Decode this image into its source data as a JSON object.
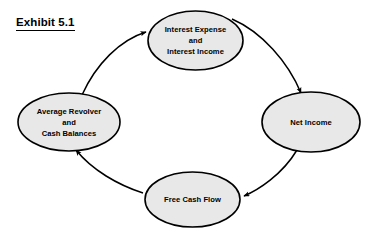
{
  "title": {
    "text": "Exhibit 5.1"
  },
  "colors": {
    "background": "#ffffff",
    "node_fill": "#e8e8e8",
    "node_stroke": "#000000",
    "arrow": "#000000",
    "text": "#000000"
  },
  "diagram": {
    "type": "cycle",
    "direction": "clockwise",
    "nodes": [
      {
        "id": "interest",
        "name": "interest-expense-and-income",
        "lines": [
          "Interest Expense",
          "and",
          "Interest Income"
        ],
        "cx": 195.5,
        "cy": 40.5,
        "rx": 47.5,
        "ry": 29.5
      },
      {
        "id": "net-income",
        "name": "net-income",
        "lines": [
          "Net Income"
        ],
        "cx": 311,
        "cy": 122,
        "rx": 49,
        "ry": 30
      },
      {
        "id": "free-cash-flow",
        "name": "free-cash-flow",
        "lines": [
          "Free Cash Flow"
        ],
        "cx": 192.5,
        "cy": 199.5,
        "rx": 47.5,
        "ry": 27.5
      },
      {
        "id": "revolver",
        "name": "average-revolver-and-cash-balances",
        "lines": [
          "Average Revolver",
          "and",
          "Cash Balances"
        ],
        "cx": 69,
        "cy": 122,
        "rx": 51,
        "ry": 29
      }
    ],
    "edges": [
      {
        "from": "interest",
        "to": "net-income",
        "name": "edge-interest-to-net-income"
      },
      {
        "from": "net-income",
        "to": "free-cash-flow",
        "name": "edge-net-income-to-free-cash-flow"
      },
      {
        "from": "free-cash-flow",
        "to": "revolver",
        "name": "edge-free-cash-flow-to-revolver"
      },
      {
        "from": "revolver",
        "to": "interest",
        "name": "edge-revolver-to-interest"
      }
    ]
  }
}
